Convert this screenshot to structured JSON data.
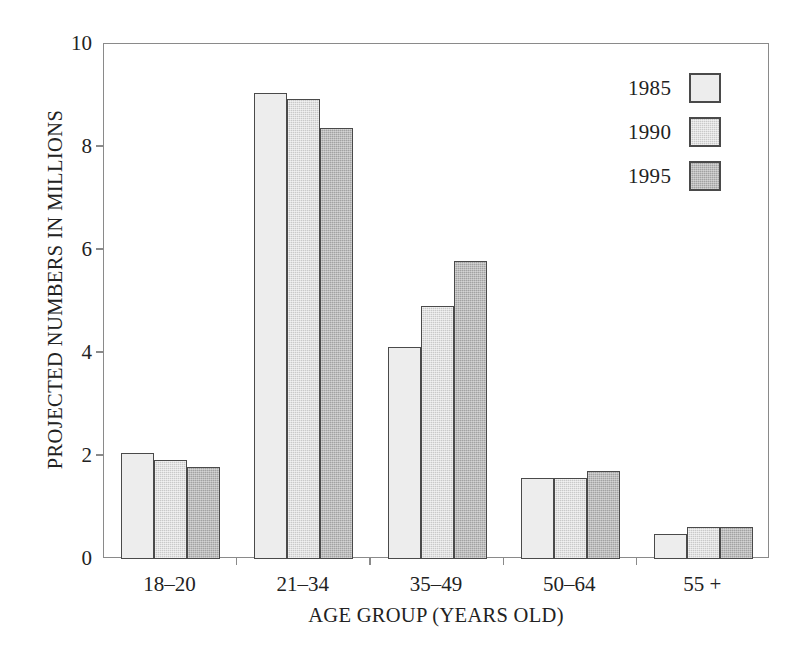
{
  "chart_data": {
    "type": "bar",
    "title": "",
    "subtitle": "",
    "xlabel": "AGE GROUP (YEARS OLD)",
    "ylabel": "PROJECTED NUMBERS IN MILLIONS",
    "categories": [
      "18–20",
      "21–34",
      "35–49",
      "50–64",
      "55 +"
    ],
    "series": [
      {
        "name": "1985",
        "color": "#ededed",
        "values": [
          2.05,
          9.05,
          4.12,
          1.58,
          0.49
        ]
      },
      {
        "name": "1990",
        "color": "#c9c9c9",
        "values": [
          1.92,
          8.93,
          4.91,
          1.58,
          0.62
        ]
      },
      {
        "name": "1995",
        "color": "#a2a2a2",
        "values": [
          1.78,
          8.37,
          5.79,
          1.7,
          0.62
        ]
      }
    ],
    "ylim": [
      0,
      10
    ],
    "yticks": [
      0,
      2,
      4,
      6,
      8,
      10
    ],
    "ytick_labels": [
      "0",
      "2",
      "4",
      "6",
      "8",
      "10"
    ],
    "grid": false,
    "legend_position": "top-right",
    "legend_entries": [
      "1985",
      "1990",
      "1995"
    ],
    "bar_border_color": "#4a4a4a",
    "axis_color": "#8a8a8a",
    "background": "#ffffff"
  }
}
